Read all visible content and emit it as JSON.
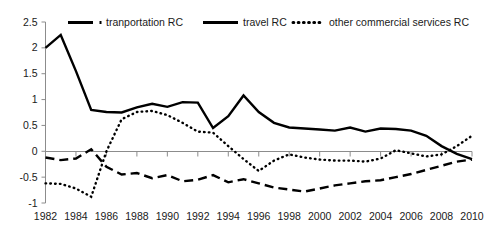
{
  "chart_data": {
    "type": "line",
    "title": "",
    "subtitle": "",
    "xlabel": "",
    "ylabel": "",
    "grid": false,
    "legend_position": "top",
    "xlim": [
      1982,
      2010
    ],
    "ylim": [
      -1,
      2.5
    ],
    "y_ticks": [
      "2.5",
      "2",
      "1.5",
      "1",
      "0.5",
      "0",
      "-0.5",
      "-1"
    ],
    "y_tick_values": [
      2.5,
      2,
      1.5,
      1,
      0.5,
      0,
      -0.5,
      -1
    ],
    "x_ticks": [
      "1982",
      "1984",
      "1986",
      "1988",
      "1990",
      "1992",
      "1994",
      "1996",
      "1998",
      "2000",
      "2002",
      "2004",
      "2006",
      "2008",
      "2010"
    ],
    "x": [
      1982,
      1983,
      1984,
      1985,
      1986,
      1987,
      1988,
      1989,
      1990,
      1991,
      1992,
      1993,
      1994,
      1995,
      1996,
      1997,
      1998,
      1999,
      2000,
      2001,
      2002,
      2003,
      2004,
      2005,
      2006,
      2007,
      2008,
      2009,
      2010
    ],
    "series": [
      {
        "name": "tranportation RC",
        "style": "dash-dot",
        "values": [
          -0.12,
          -0.17,
          -0.14,
          0.04,
          -0.3,
          -0.45,
          -0.42,
          -0.52,
          -0.46,
          -0.58,
          -0.55,
          -0.46,
          -0.6,
          -0.54,
          -0.62,
          -0.7,
          -0.74,
          -0.78,
          -0.72,
          -0.66,
          -0.62,
          -0.58,
          -0.56,
          -0.5,
          -0.44,
          -0.36,
          -0.28,
          -0.2,
          -0.16
        ]
      },
      {
        "name": "travel RC",
        "style": "solid",
        "values": [
          2.0,
          2.25,
          1.55,
          0.8,
          0.76,
          0.75,
          0.85,
          0.92,
          0.86,
          0.95,
          0.94,
          0.45,
          0.68,
          1.08,
          0.76,
          0.55,
          0.46,
          0.44,
          0.42,
          0.4,
          0.46,
          0.38,
          0.44,
          0.43,
          0.4,
          0.3,
          0.1,
          -0.05,
          -0.15
        ]
      },
      {
        "name": "other commercial services RC",
        "style": "dotted",
        "values": [
          -0.62,
          -0.63,
          -0.72,
          -0.88,
          0.0,
          0.62,
          0.76,
          0.78,
          0.7,
          0.55,
          0.38,
          0.36,
          0.1,
          -0.15,
          -0.38,
          -0.18,
          -0.06,
          -0.12,
          -0.16,
          -0.18,
          -0.18,
          -0.2,
          -0.14,
          0.02,
          -0.04,
          -0.1,
          -0.06,
          0.1,
          0.3
        ]
      }
    ]
  },
  "legend": {
    "items": [
      {
        "label": "tranportation RC",
        "style": "dash-dot"
      },
      {
        "label": "travel RC",
        "style": "solid"
      },
      {
        "label": "other commercial services RC",
        "style": "dotted"
      }
    ]
  },
  "colors": {
    "series_stroke": "#000000",
    "axis": "#8c8c8c",
    "text": "#1a1a1a",
    "background": "#ffffff"
  }
}
